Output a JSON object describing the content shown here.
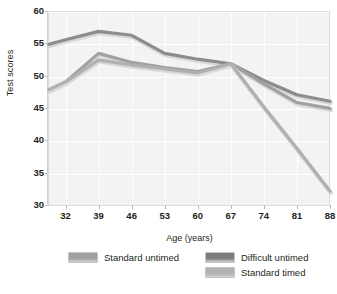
{
  "chart_data": {
    "type": "line",
    "title": "",
    "xlabel": "Age (years)",
    "ylabel": "Test scores",
    "xlim": [
      28.5,
      88
    ],
    "ylim": [
      30,
      60
    ],
    "yticks": [
      30,
      35,
      40,
      45,
      50,
      55,
      60
    ],
    "xticks": [
      32,
      39,
      46,
      53,
      60,
      67,
      74,
      81,
      88
    ],
    "grid": true,
    "legend_position": "bottom",
    "x": [
      28.5,
      32,
      39,
      46,
      53,
      60,
      67,
      74,
      81,
      88
    ],
    "series": [
      {
        "name": "Difficult untimed",
        "color": "#8c8c8c",
        "values": [
          55.0,
          55.7,
          57.0,
          56.4,
          53.6,
          52.7,
          52.0,
          49.4,
          47.2,
          46.2
        ]
      },
      {
        "name": "Standard untimed",
        "color": "#a0a0a0",
        "values": [
          48.0,
          49.2,
          53.6,
          52.2,
          51.4,
          50.8,
          52.0,
          48.9,
          46.0,
          45.1
        ]
      },
      {
        "name": "Standard timed",
        "color": "#b0b0b0",
        "values": [
          48.0,
          49.2,
          52.6,
          51.8,
          51.2,
          50.6,
          52.0,
          45.3,
          38.9,
          32.3
        ]
      }
    ]
  },
  "legend": {
    "items": [
      {
        "label": "Standard untimed",
        "color": "#a0a0a0"
      },
      {
        "label": "Difficult untimed",
        "color": "#7d7d7d"
      },
      {
        "label": "Standard timed",
        "color": "#b3b3b3"
      }
    ]
  },
  "axes": {
    "y_title": "Test scores",
    "x_title": "Age (years)",
    "y_tick_labels": [
      "60",
      "55",
      "50",
      "45",
      "40",
      "35",
      "30"
    ],
    "x_tick_labels": [
      "32",
      "39",
      "46",
      "53",
      "60",
      "67",
      "74",
      "81",
      "88"
    ]
  }
}
